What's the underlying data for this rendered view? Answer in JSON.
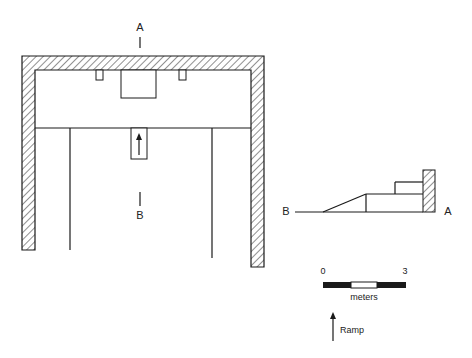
{
  "plan": {
    "section_marker_top": "A",
    "section_marker_bottom": "B"
  },
  "section": {
    "left_label": "B",
    "right_label": "A"
  },
  "scale": {
    "start": "0",
    "end": "3",
    "unit": "meters"
  },
  "legend": {
    "ramp_label": "Ramp",
    "icon": "up-arrow-icon"
  },
  "colors": {
    "line": "#1a1a1a",
    "background": "#ffffff"
  }
}
